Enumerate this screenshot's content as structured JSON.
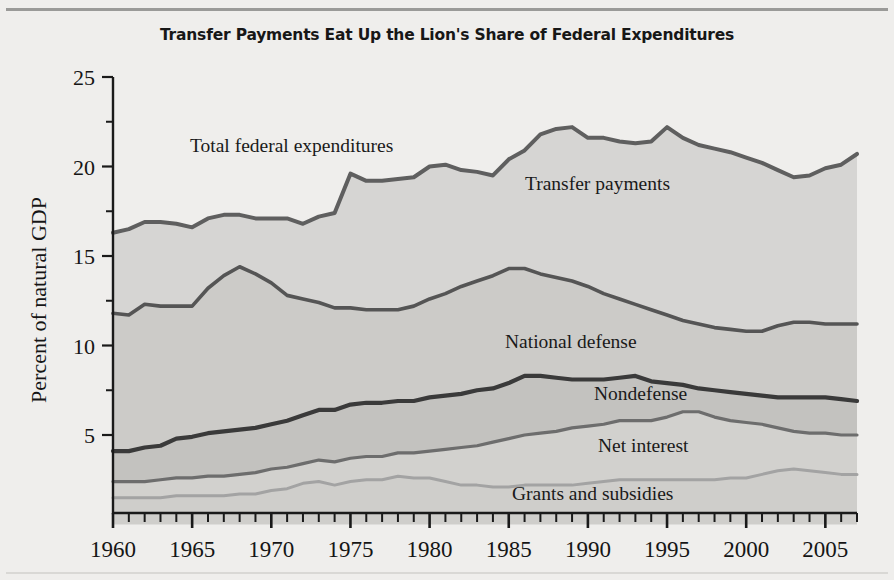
{
  "figure": {
    "title": "Transfer Payments Eat Up the Lion's Share of Federal Expenditures",
    "background_color": "#efeeec"
  },
  "axes": {
    "ylabel": "Percent of natural GDP",
    "yticks": [
      "5",
      "10",
      "15",
      "20",
      "25"
    ],
    "xticks": [
      "1960",
      "1965",
      "1970",
      "1975",
      "1980",
      "1985",
      "1990",
      "1995",
      "2000",
      "2005"
    ]
  },
  "series_labels": {
    "total": "Total federal expenditures",
    "transfer": "Transfer payments",
    "defense": "National defense",
    "nondefense": "Nondefense",
    "interest": "Net interest",
    "grants": "Grants and subsidies"
  },
  "colors": {
    "band_transfer": "#d6d5d3",
    "band_defense": "#cccbc8",
    "band_nondefense": "#c3c2bf",
    "band_interest": "#d2d1ce",
    "band_grants": "#cfcecb",
    "line_total": "#5f5f5f",
    "line_defense": "#555555",
    "line_nondefense": "#3a3a3a",
    "line_interest": "#6d6d6d",
    "line_grants": "#a3a3a3",
    "axis": "#1a1a1a",
    "title": "#171717"
  },
  "chart_data": {
    "type": "area",
    "title": "Transfer Payments Eat Up the Lion's Share of Federal Expenditures",
    "xlabel": "",
    "ylabel": "Percent of natural GDP",
    "stacked": true,
    "ylim": [
      0,
      25
    ],
    "xlim": [
      1960,
      2007
    ],
    "grid": false,
    "legend": "inline-labels",
    "note": "Cumulative boundary lines, percent of natural GDP. Bottom-to-top order: grants and subsidies, net interest, nondefense, national defense, transfer payments; topmost curve is total federal expenditures.",
    "x": [
      1960,
      1961,
      1962,
      1963,
      1964,
      1965,
      1966,
      1967,
      1968,
      1969,
      1970,
      1971,
      1972,
      1973,
      1974,
      1975,
      1976,
      1977,
      1978,
      1979,
      1980,
      1981,
      1982,
      1983,
      1984,
      1985,
      1986,
      1987,
      1988,
      1989,
      1990,
      1991,
      1992,
      1993,
      1994,
      1995,
      1996,
      1997,
      1998,
      1999,
      2000,
      2001,
      2002,
      2003,
      2004,
      2005,
      2006,
      2007
    ],
    "series": [
      {
        "name": "Grants and subsidies",
        "cumulative": true,
        "values": [
          1.5,
          1.5,
          1.5,
          1.5,
          1.6,
          1.6,
          1.6,
          1.6,
          1.7,
          1.7,
          1.9,
          2.0,
          2.3,
          2.4,
          2.2,
          2.4,
          2.5,
          2.5,
          2.7,
          2.6,
          2.6,
          2.4,
          2.2,
          2.2,
          2.1,
          2.1,
          2.2,
          2.2,
          2.2,
          2.2,
          2.3,
          2.4,
          2.5,
          2.5,
          2.5,
          2.5,
          2.5,
          2.5,
          2.5,
          2.6,
          2.6,
          2.8,
          3.0,
          3.1,
          3.0,
          2.9,
          2.8,
          2.8
        ]
      },
      {
        "name": "Net interest",
        "cumulative": true,
        "values": [
          2.4,
          2.4,
          2.4,
          2.5,
          2.6,
          2.6,
          2.7,
          2.7,
          2.8,
          2.9,
          3.1,
          3.2,
          3.4,
          3.6,
          3.5,
          3.7,
          3.8,
          3.8,
          4.0,
          4.0,
          4.1,
          4.2,
          4.3,
          4.4,
          4.6,
          4.8,
          5.0,
          5.1,
          5.2,
          5.4,
          5.5,
          5.6,
          5.8,
          5.8,
          5.8,
          6.0,
          6.3,
          6.3,
          6.0,
          5.8,
          5.7,
          5.6,
          5.4,
          5.2,
          5.1,
          5.1,
          5.0,
          5.0
        ]
      },
      {
        "name": "Nondefense",
        "cumulative": true,
        "values": [
          4.1,
          4.1,
          4.3,
          4.4,
          4.8,
          4.9,
          5.1,
          5.2,
          5.3,
          5.4,
          5.6,
          5.8,
          6.1,
          6.4,
          6.4,
          6.7,
          6.8,
          6.8,
          6.9,
          6.9,
          7.1,
          7.2,
          7.3,
          7.5,
          7.6,
          7.9,
          8.3,
          8.3,
          8.2,
          8.1,
          8.1,
          8.1,
          8.2,
          8.3,
          8.0,
          7.9,
          7.8,
          7.6,
          7.5,
          7.4,
          7.3,
          7.2,
          7.1,
          7.1,
          7.1,
          7.1,
          7.0,
          6.9
        ]
      },
      {
        "name": "National defense",
        "cumulative": true,
        "values": [
          11.8,
          11.7,
          12.3,
          12.2,
          12.2,
          12.2,
          13.2,
          13.9,
          14.4,
          14.0,
          13.5,
          12.8,
          12.6,
          12.4,
          12.1,
          12.1,
          12.0,
          12.0,
          12.0,
          12.2,
          12.6,
          12.9,
          13.3,
          13.6,
          13.9,
          14.3,
          14.3,
          14.0,
          13.8,
          13.6,
          13.3,
          12.9,
          12.6,
          12.3,
          12.0,
          11.7,
          11.4,
          11.2,
          11.0,
          10.9,
          10.8,
          10.8,
          11.1,
          11.3,
          11.3,
          11.2,
          11.2,
          11.2
        ]
      },
      {
        "name": "Transfer payments",
        "cumulative": true,
        "label_for_top": "Total federal expenditures",
        "values": [
          16.3,
          16.5,
          16.9,
          16.9,
          16.8,
          16.6,
          17.1,
          17.3,
          17.3,
          17.1,
          17.1,
          17.1,
          16.8,
          17.2,
          17.4,
          19.6,
          19.2,
          19.2,
          19.3,
          19.4,
          20.0,
          20.1,
          19.8,
          19.7,
          19.5,
          20.4,
          20.9,
          21.8,
          22.1,
          22.2,
          21.6,
          21.6,
          21.4,
          21.3,
          21.4,
          22.2,
          21.6,
          21.2,
          21.0,
          20.8,
          20.5,
          20.2,
          19.8,
          19.4,
          19.5,
          19.9,
          20.1,
          20.7
        ]
      }
    ]
  }
}
